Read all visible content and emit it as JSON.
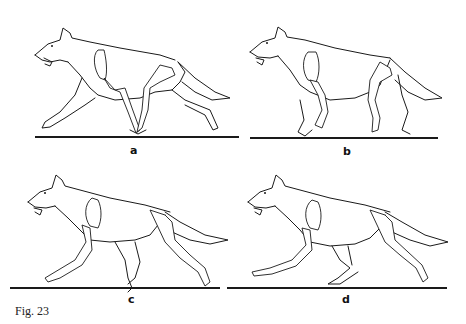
{
  "figure": {
    "caption": "Fig. 23",
    "panels": [
      {
        "id": "a",
        "label": "a",
        "ground": {
          "x": 35,
          "y": 137,
          "w": 204
        },
        "label_pos": {
          "x": 130,
          "y": 145
        }
      },
      {
        "id": "b",
        "label": "b",
        "ground": {
          "x": 250,
          "y": 138,
          "w": 188
        },
        "label_pos": {
          "x": 343,
          "y": 146
        }
      },
      {
        "id": "c",
        "label": "c",
        "ground": {
          "x": 10,
          "y": 288,
          "w": 210
        },
        "label_pos": {
          "x": 128,
          "y": 294
        }
      },
      {
        "id": "d",
        "label": "d",
        "ground": {
          "x": 227,
          "y": 288,
          "w": 220
        },
        "label_pos": {
          "x": 342,
          "y": 294
        }
      }
    ]
  }
}
